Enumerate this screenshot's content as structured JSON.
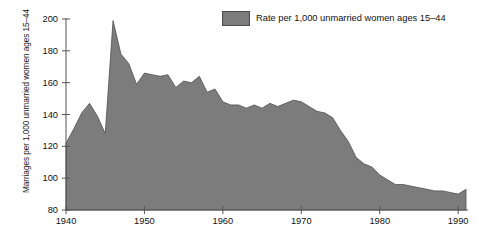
{
  "chart_data": {
    "type": "area",
    "title": "",
    "xlabel": "",
    "ylabel": "Marriages per 1,000 unmarried women ages 15–44",
    "xlim": [
      1940,
      1991
    ],
    "ylim": [
      80,
      200
    ],
    "grid": false,
    "legend_position": "top-right",
    "series_color": "#7c7c7c",
    "x_ticks": [
      "1940",
      "1950",
      "1960",
      "1970",
      "1980",
      "1990"
    ],
    "x_tick_values": [
      1940,
      1950,
      1960,
      1970,
      1980,
      1990
    ],
    "y_ticks": [
      "80",
      "100",
      "120",
      "140",
      "160",
      "180",
      "200"
    ],
    "y_tick_values": [
      80,
      100,
      120,
      140,
      160,
      180,
      200
    ],
    "series": [
      {
        "name": "Rate per 1,000 unmarried women ages 15–44",
        "x": [
          1940,
          1941,
          1942,
          1943,
          1944,
          1945,
          1946,
          1947,
          1948,
          1949,
          1950,
          1951,
          1952,
          1953,
          1954,
          1955,
          1956,
          1957,
          1958,
          1959,
          1960,
          1961,
          1962,
          1963,
          1964,
          1965,
          1966,
          1967,
          1968,
          1969,
          1970,
          1971,
          1972,
          1973,
          1974,
          1975,
          1976,
          1977,
          1978,
          1979,
          1980,
          1981,
          1982,
          1983,
          1984,
          1985,
          1986,
          1987,
          1988,
          1989,
          1990,
          1991
        ],
        "values": [
          122,
          131,
          141,
          147,
          139,
          128,
          199,
          178,
          172,
          159,
          166,
          165,
          164,
          165,
          157,
          161,
          160,
          164,
          154,
          156,
          148,
          146,
          146,
          144,
          146,
          144,
          147,
          145,
          147,
          149,
          148,
          145,
          142,
          141,
          138,
          130,
          123,
          113,
          109,
          107,
          102,
          99,
          96,
          96,
          95,
          94,
          93,
          92,
          92,
          91,
          90,
          93
        ]
      }
    ]
  },
  "legend": {
    "label": "Rate per 1,000 unmarried women ages 15–44"
  },
  "axes": {
    "y_title": "Marriages per 1,000 unmarried women ages 15–44"
  }
}
